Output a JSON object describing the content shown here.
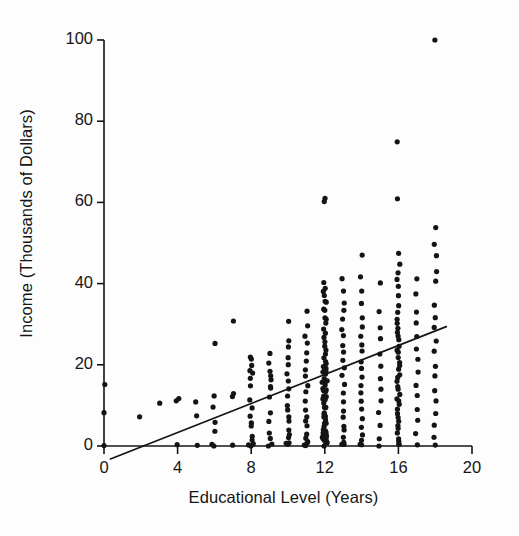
{
  "figure": {
    "background_color": "#fdfdfd",
    "ink_color": "#141414",
    "x_axis_title": "Educational Level (Years)",
    "y_axis_title": "Income (Thousands of Dollars)"
  },
  "chart_data": {
    "type": "scatter",
    "title": "",
    "xlabel": "Educational Level (Years)",
    "ylabel": "Income (Thousands of Dollars)",
    "xlim": [
      0,
      20
    ],
    "ylim": [
      0,
      100
    ],
    "xticks": [
      0,
      4,
      8,
      12,
      16,
      20
    ],
    "yticks": [
      0,
      20,
      40,
      60,
      80,
      100
    ],
    "xtick_labels": [
      "0",
      "4",
      "8",
      "12",
      "16",
      "20"
    ],
    "ytick_labels": [
      "0",
      "20",
      "40",
      "60",
      "80",
      "100"
    ],
    "grid": false,
    "legend": null,
    "marker": {
      "shape": "circle",
      "size": 2.6,
      "color": "#141414"
    },
    "trendline": {
      "type": "linear",
      "color": "#141414",
      "width": 1.7,
      "x_start": 0.35,
      "y_start": -3.2,
      "x_end": 18.6,
      "y_end": 29.4,
      "x_intercept": 2.6,
      "slope": 1.79,
      "intercept": -4.65
    },
    "columns": [
      {
        "x": 0,
        "values": [
          0,
          8,
          15
        ]
      },
      {
        "x": 2,
        "values": [
          7
        ]
      },
      {
        "x": 3,
        "values": [
          11
        ]
      },
      {
        "x": 4,
        "values": [
          0,
          11,
          12
        ]
      },
      {
        "x": 5,
        "values": [
          0,
          7,
          11
        ]
      },
      {
        "x": 6,
        "values": [
          0,
          0,
          4,
          6,
          10,
          12,
          25
        ]
      },
      {
        "x": 7,
        "values": [
          0,
          12,
          13,
          31
        ]
      },
      {
        "x": 8,
        "values": [
          0,
          0,
          0,
          1,
          2,
          5,
          6,
          7,
          9,
          11,
          15,
          17,
          18,
          19,
          20,
          21,
          22
        ]
      },
      {
        "x": 9,
        "values": [
          0,
          0,
          2,
          3,
          6,
          8,
          12,
          14,
          15,
          16,
          17,
          18,
          20,
          23
        ]
      },
      {
        "x": 10,
        "values": [
          0,
          0,
          0,
          2,
          3,
          4,
          6,
          7,
          9,
          10,
          12,
          14,
          16,
          18,
          20,
          22,
          24,
          26,
          31
        ]
      },
      {
        "x": 11,
        "values": [
          0,
          0,
          0,
          1,
          2,
          3,
          5,
          6,
          7,
          9,
          11,
          13,
          15,
          17,
          19,
          21,
          23,
          25,
          27,
          30,
          33
        ]
      },
      {
        "x": 12,
        "values": [
          0,
          0,
          0,
          0,
          0,
          0,
          0,
          0,
          1,
          1,
          2,
          2,
          3,
          3,
          4,
          4,
          5,
          5,
          6,
          6,
          7,
          7,
          8,
          8,
          9,
          9,
          10,
          10,
          11,
          11,
          12,
          12,
          13,
          13,
          14,
          14,
          15,
          15,
          16,
          16,
          17,
          17,
          18,
          18,
          19,
          19,
          20,
          20,
          21,
          22,
          23,
          24,
          25,
          26,
          27,
          28,
          29,
          30,
          31,
          32,
          33,
          34,
          35,
          36,
          37,
          38,
          39,
          40,
          60,
          61
        ]
      },
      {
        "x": 13,
        "values": [
          0,
          0,
          1,
          2,
          4,
          5,
          7,
          9,
          11,
          13,
          15,
          17,
          19,
          21,
          23,
          25,
          27,
          29,
          31,
          33,
          35,
          38,
          41
        ]
      },
      {
        "x": 14,
        "values": [
          0,
          0,
          1,
          3,
          5,
          7,
          9,
          11,
          13,
          15,
          17,
          19,
          21,
          23,
          25,
          27,
          29,
          32,
          35,
          38,
          42,
          47
        ]
      },
      {
        "x": 15,
        "values": [
          0,
          2,
          5,
          8,
          11,
          14,
          17,
          20,
          23,
          26,
          29,
          33,
          40
        ]
      },
      {
        "x": 16,
        "values": [
          0,
          0,
          1,
          2,
          3,
          4,
          5,
          6,
          7,
          8,
          9,
          10,
          11,
          12,
          13,
          14,
          15,
          16,
          17,
          18,
          19,
          20,
          21,
          22,
          23,
          24,
          25,
          26,
          27,
          28,
          29,
          30,
          31,
          33,
          35,
          37,
          39,
          41,
          43,
          45,
          47,
          61,
          75
        ]
      },
      {
        "x": 17,
        "values": [
          0,
          3,
          6,
          9,
          12,
          15,
          18,
          21,
          24,
          27,
          30,
          33,
          37,
          41
        ]
      },
      {
        "x": 18,
        "values": [
          0,
          2,
          5,
          8,
          11,
          14,
          17,
          20,
          23,
          26,
          29,
          32,
          35,
          41,
          43,
          47,
          50,
          54,
          100
        ]
      }
    ]
  }
}
